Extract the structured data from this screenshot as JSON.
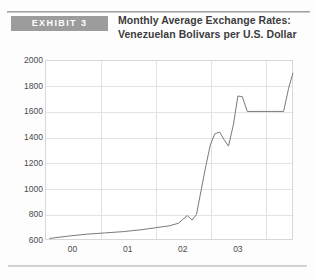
{
  "exhibit": {
    "badge_label": "EXHIBIT 3",
    "badge_color": "#9c9c9c",
    "badge_text_color": "#ffffff"
  },
  "title": {
    "line1": "Monthly Average Exchange Rates:",
    "line2": "Venezuelan Bolivars per U.S. Dollar",
    "color": "#3c3c3e"
  },
  "rules": {
    "top_color": "#8e8e90",
    "bottom_color": "#c9c9cb"
  },
  "chart_data": {
    "type": "line",
    "title": "Monthly Average Exchange Rates: Venezuelan Bolivars per U.S. Dollar",
    "xlabel": "",
    "ylabel": "",
    "ylim": [
      600,
      2000
    ],
    "ytick_values": [
      600,
      800,
      1000,
      1200,
      1400,
      1600,
      1800,
      2000
    ],
    "ytick_labels": [
      "600",
      "800",
      "1000",
      "1200",
      "1400",
      "1600",
      "1800",
      "2000"
    ],
    "xlim": [
      1999.5,
      2004.0
    ],
    "xtick_labels": [
      "00",
      "01",
      "02",
      "03"
    ],
    "xtick_positions": [
      2000.0,
      2001.0,
      2002.0,
      2003.0
    ],
    "xgrid_positions": [
      2000.5,
      2001.5,
      2002.5,
      2003.5
    ],
    "grid": true,
    "legend": "none",
    "line_color": "#7a7a7c",
    "line_width": 1,
    "series": [
      {
        "name": "Bolivars per U.S. Dollar",
        "x": [
          1999.58,
          1999.92,
          2000.25,
          2000.58,
          2000.92,
          2001.25,
          2001.5,
          2001.75,
          2001.92,
          2002.0,
          2002.08,
          2002.17,
          2002.25,
          2002.33,
          2002.42,
          2002.5,
          2002.58,
          2002.67,
          2002.75,
          2002.83,
          2002.92,
          2003.0,
          2003.08,
          2003.17,
          2003.42,
          2003.67,
          2003.83,
          2003.92,
          2004.0
        ],
        "values": [
          612,
          630,
          645,
          655,
          665,
          680,
          695,
          710,
          730,
          760,
          790,
          755,
          800,
          980,
          1180,
          1340,
          1425,
          1440,
          1380,
          1330,
          1500,
          1720,
          1715,
          1600,
          1600,
          1600,
          1600,
          1780,
          1900
        ]
      }
    ],
    "annotations": []
  }
}
